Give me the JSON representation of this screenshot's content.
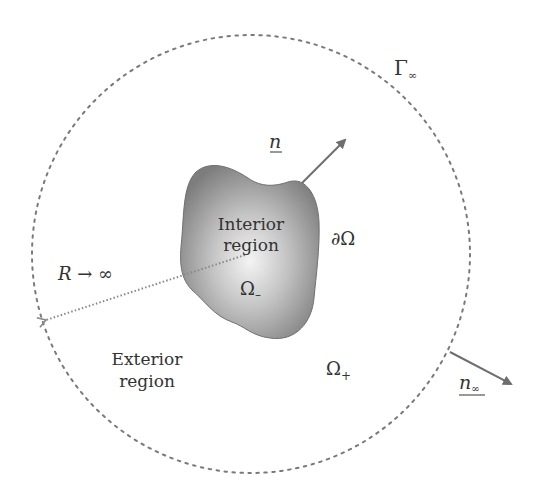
{
  "diagram": {
    "type": "domain-boundary-schematic",
    "colors": {
      "background": "#ffffff",
      "circle_stroke": "#7a7a7a",
      "arrow": "#6e6e6e",
      "blob_center": "#f4f4f4",
      "blob_edge": "#7d7d7d",
      "text": "#333333"
    },
    "labels": {
      "gamma_infinity": "Γ",
      "gamma_infinity_sub": "∞",
      "normal": "n",
      "interior_line1": "Interior",
      "interior_line2": "region",
      "boundary": "∂Ω",
      "omega_minus": "Ω",
      "omega_minus_sub": "–",
      "radius": "R → ∞",
      "exterior_line1": "Exterior",
      "exterior_line2": "region",
      "omega_plus": "Ω",
      "omega_plus_sub": "+",
      "normal_infinity": "n",
      "normal_infinity_sub": "∞"
    },
    "elements": {
      "outer_boundary": {
        "shape": "dashed-circle",
        "cx": 251,
        "cy": 254,
        "r": 219
      },
      "interior_region": {
        "shape": "irregular-blob",
        "fill": "radial-gradient"
      },
      "normal_vector": {
        "from": [
          302,
          183
        ],
        "to": [
          345,
          140
        ]
      },
      "normal_vector_infinity": {
        "from": [
          450,
          352
        ],
        "to": [
          511,
          384
        ]
      },
      "radius_line": {
        "style": "dotted",
        "from": [
          245,
          255
        ],
        "to": [
          44,
          321
        ]
      }
    }
  }
}
